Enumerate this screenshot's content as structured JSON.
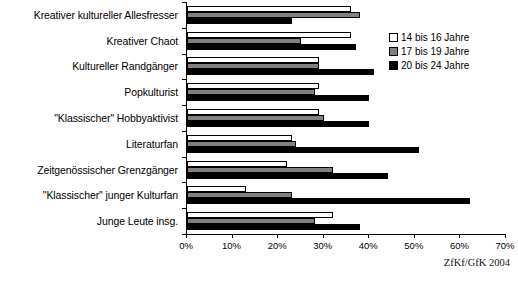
{
  "chart_data": {
    "type": "bar",
    "orientation": "horizontal",
    "title": "",
    "xlabel": "",
    "ylabel": "",
    "xlim": [
      0,
      70
    ],
    "xticks": [
      0,
      10,
      20,
      30,
      40,
      50,
      60,
      70
    ],
    "xticklabels": [
      "0%",
      "10%",
      "20%",
      "30%",
      "40%",
      "50%",
      "60%",
      "70%"
    ],
    "grid": false,
    "legend_position": "upper right",
    "source_note": "ZfKf/GfK 2004",
    "categories": [
      "Kreativer kultureller Allesfresser",
      "Kreativer Chaot",
      "Kultureller  Randgänger",
      "Popkulturist",
      "\"Klassischer\" Hobbyaktivist",
      "Literaturfan",
      "Zeitgenössischer Grenzgänger",
      "\"Klassischer\" junger Kulturfan",
      "Junge Leute insg."
    ],
    "series": [
      {
        "name": "14 bis 16 Jahre",
        "color": "#ffffff",
        "values": [
          36,
          36,
          29,
          29,
          29,
          23,
          22,
          13,
          32
        ]
      },
      {
        "name": "17 bis 19 Jahre",
        "color": "#808080",
        "values": [
          38,
          25,
          29,
          28,
          30,
          24,
          32,
          23,
          28
        ]
      },
      {
        "name": "20 bis 24 Jahre",
        "color": "#000000",
        "values": [
          23,
          37,
          41,
          40,
          40,
          51,
          44,
          62,
          38
        ]
      }
    ]
  },
  "legend": {
    "items": [
      {
        "label": "14 bis 16 Jahre"
      },
      {
        "label": "17 bis 19 Jahre"
      },
      {
        "label": "20 bis 24 Jahre"
      }
    ]
  },
  "source": {
    "text": "ZfKf/GfK 2004"
  }
}
